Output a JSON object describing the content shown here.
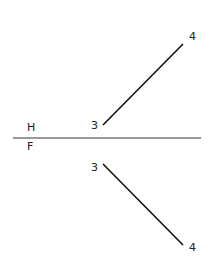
{
  "diagram": {
    "type": "orthographic-projection",
    "folding_line": {
      "x1": 13,
      "y1": 138,
      "x2": 201,
      "y2": 138,
      "top_label": "H",
      "bottom_label": "F"
    },
    "top_view": {
      "line": {
        "x1": 103,
        "y1": 125,
        "x2": 183,
        "y2": 44
      },
      "start_label": "3",
      "end_label": "4"
    },
    "front_view": {
      "line": {
        "x1": 103,
        "y1": 164,
        "x2": 183,
        "y2": 245
      },
      "start_label": "3",
      "end_label": "4"
    },
    "stroke_color": "#111111"
  }
}
